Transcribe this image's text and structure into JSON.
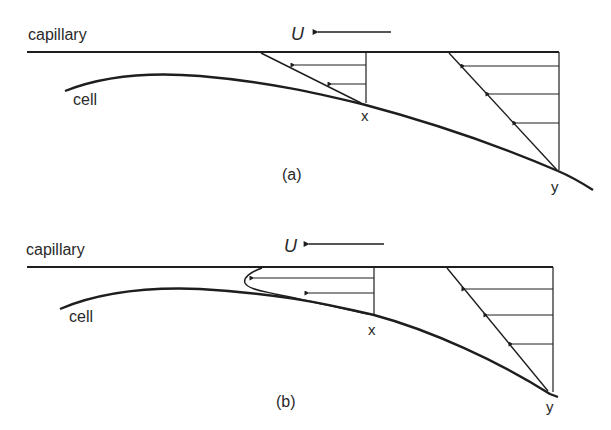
{
  "figure": {
    "panels": [
      {
        "id": "a",
        "caption": "(a)",
        "wall_label": "capillary",
        "cell_label": "cell",
        "velocity_label": "U",
        "point_labels": [
          "x",
          "y"
        ],
        "description": "Linear (Couette) velocity profiles in the gap between capillary wall and cell"
      },
      {
        "id": "b",
        "caption": "(b)",
        "wall_label": "capillary",
        "cell_label": "cell",
        "velocity_label": "U",
        "point_labels": [
          "x",
          "y"
        ],
        "description": "Velocity profiles with flow reversal near the narrow gap at x"
      }
    ],
    "colors": {
      "line": "#1e1e1e",
      "text": "#2a2a2a",
      "background": "#ffffff"
    }
  }
}
